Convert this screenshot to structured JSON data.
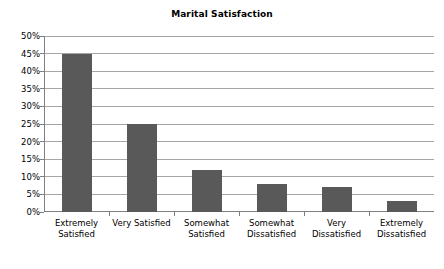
{
  "chart_data": {
    "type": "bar",
    "title": "Marital Satisfaction",
    "xlabel": "",
    "ylabel": "",
    "ylim": [
      0,
      50
    ],
    "ytick_step": 5,
    "grid": true,
    "legend": false,
    "categories": [
      "Extremely Satisfied",
      "Very Satisfied",
      "Somewhat Satisfied",
      "Somewhat Dissatisfied",
      "Very Dissatisfied",
      "Extremely Dissatisfied"
    ],
    "category_lines": [
      [
        "Extremely",
        "Satisfied"
      ],
      [
        "Very Satisfied",
        ""
      ],
      [
        "Somewhat",
        "Satisfied"
      ],
      [
        "Somewhat",
        "Dissatisfied"
      ],
      [
        "Very",
        "Dissatisfied"
      ],
      [
        "Extremely",
        "Dissatisfied"
      ]
    ],
    "values": [
      45,
      25,
      12,
      8,
      7,
      3
    ],
    "value_labels": [
      "45%",
      "25%",
      "12%",
      "8%",
      "7%",
      "3%"
    ],
    "ytick_labels": [
      "0%",
      "5%",
      "10%",
      "15%",
      "20%",
      "25%",
      "30%",
      "35%",
      "40%",
      "45%",
      "50%"
    ],
    "ytick_values": [
      0,
      5,
      10,
      15,
      20,
      25,
      30,
      35,
      40,
      45,
      50
    ],
    "colors": {
      "bar_fill": "#595959",
      "gridline": "#a6a6a6",
      "axis_line": "#808080",
      "text": "#000000",
      "background": "#ffffff"
    }
  }
}
